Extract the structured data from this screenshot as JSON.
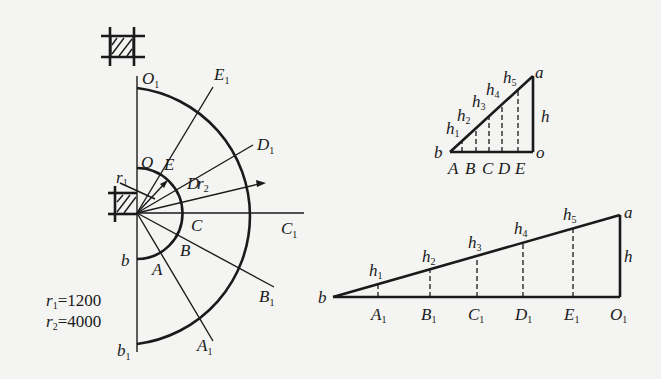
{
  "figure": {
    "type": "cone development / true-length construction",
    "left_diagram": {
      "center_label": "O",
      "labels": {
        "O1": "O",
        "E1": "E",
        "D1": "D",
        "C1": "C",
        "B1": "B",
        "A1": "A",
        "b1": "b",
        "O": "O",
        "E": "E",
        "D": "D",
        "C": "C",
        "B": "B",
        "A": "A",
        "b": "b",
        "r1": "r",
        "r2": "r"
      },
      "subscripts": {
        "one": "1",
        "two": "2"
      },
      "radii_notes": [
        {
          "sym": "r",
          "sub": "1",
          "value": "=1200"
        },
        {
          "sym": "r",
          "sub": "2",
          "value": "=4000"
        }
      ]
    },
    "small_triangle": {
      "vertices": {
        "a": "a",
        "b": "b",
        "o": "o"
      },
      "height_label": "h",
      "base_points": [
        "A",
        "B",
        "C",
        "D",
        "E"
      ],
      "slant_labels": [
        {
          "sym": "h",
          "sub": "1"
        },
        {
          "sym": "h",
          "sub": "2"
        },
        {
          "sym": "h",
          "sub": "3"
        },
        {
          "sym": "h",
          "sub": "4"
        },
        {
          "sym": "h",
          "sub": "5"
        }
      ]
    },
    "large_triangle": {
      "vertices": {
        "a": "a",
        "b": "b"
      },
      "height_label": "h",
      "base_points": [
        {
          "sym": "A",
          "sub": "1"
        },
        {
          "sym": "B",
          "sub": "1"
        },
        {
          "sym": "C",
          "sub": "1"
        },
        {
          "sym": "D",
          "sub": "1"
        },
        {
          "sym": "E",
          "sub": "1"
        },
        {
          "sym": "O",
          "sub": "1"
        }
      ],
      "slant_labels": [
        {
          "sym": "h",
          "sub": "1"
        },
        {
          "sym": "h",
          "sub": "2"
        },
        {
          "sym": "h",
          "sub": "3"
        },
        {
          "sym": "h",
          "sub": "4"
        },
        {
          "sym": "h",
          "sub": "5"
        }
      ]
    }
  }
}
